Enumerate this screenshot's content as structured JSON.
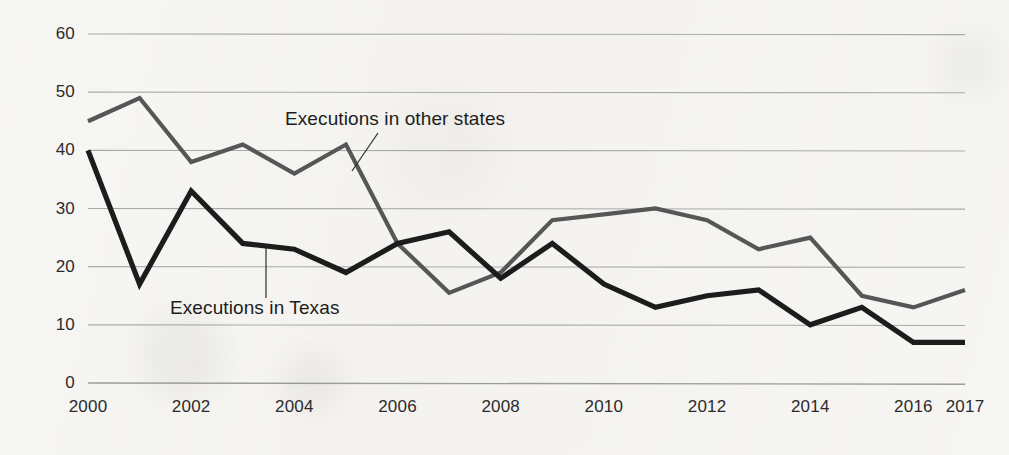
{
  "chart_data": {
    "type": "line",
    "title": "",
    "xlabel": "",
    "ylabel": "",
    "x": [
      2000,
      2001,
      2002,
      2003,
      2004,
      2005,
      2006,
      2007,
      2008,
      2009,
      2010,
      2011,
      2012,
      2013,
      2014,
      2015,
      2016,
      2017
    ],
    "xtick_labels": [
      "2000",
      "2002",
      "2004",
      "2006",
      "2008",
      "2010",
      "2012",
      "2014",
      "2016",
      "2017"
    ],
    "xticks": [
      2000,
      2002,
      2004,
      2006,
      2008,
      2010,
      2012,
      2014,
      2016,
      2017
    ],
    "ytick_labels": [
      "0",
      "10",
      "20",
      "30",
      "40",
      "50",
      "60"
    ],
    "yticks": [
      0,
      10,
      20,
      30,
      40,
      50,
      60
    ],
    "ylim": [
      0,
      60
    ],
    "xlim": [
      2000,
      2017
    ],
    "grid": "horizontal",
    "legend_position": "inline-annotations",
    "series": [
      {
        "name": "Executions in other states",
        "color": "#565656",
        "values": [
          45,
          49,
          38,
          41,
          36,
          41,
          24,
          15.5,
          19,
          28,
          29,
          30,
          28,
          23,
          25,
          15,
          13,
          16
        ]
      },
      {
        "name": "Executions in Texas",
        "color": "#1c1c1c",
        "values": [
          40,
          17,
          33,
          24,
          23,
          19,
          24,
          26,
          18,
          24,
          17,
          13,
          15,
          16,
          10,
          13,
          7,
          7
        ]
      }
    ],
    "annotations": [
      {
        "text": "Executions in other states",
        "series": "Executions in other states"
      },
      {
        "text": "Executions in Texas",
        "series": "Executions in Texas"
      }
    ]
  },
  "colors": {
    "background": "#f4f3f0",
    "gridline": "#8e8e8e",
    "text": "#2b2b2b",
    "series_other_states": "#565656",
    "series_texas": "#1c1c1c"
  }
}
